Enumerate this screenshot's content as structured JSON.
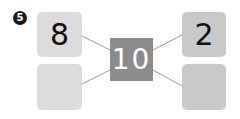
{
  "problem": {
    "number": "5"
  },
  "diagram": {
    "center": {
      "value": "10",
      "color": "#8b8b8b"
    },
    "left": {
      "top": "8",
      "bottom": "",
      "color": "#dcdcdc"
    },
    "right": {
      "top": "2",
      "bottom": "",
      "color": "#c9c9c9"
    },
    "line_color": "#999999"
  }
}
